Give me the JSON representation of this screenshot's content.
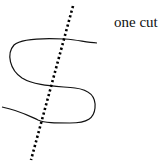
{
  "diagram": {
    "label": "one cut",
    "curve": {
      "description": "S-shaped curve",
      "color": "#111111",
      "stroke_width": 1.2
    },
    "cut_line": {
      "description": "dotted cutting line",
      "color": "#000000",
      "from": [
        73,
        6
      ],
      "to": [
        31,
        160
      ],
      "intersections": 3
    }
  }
}
